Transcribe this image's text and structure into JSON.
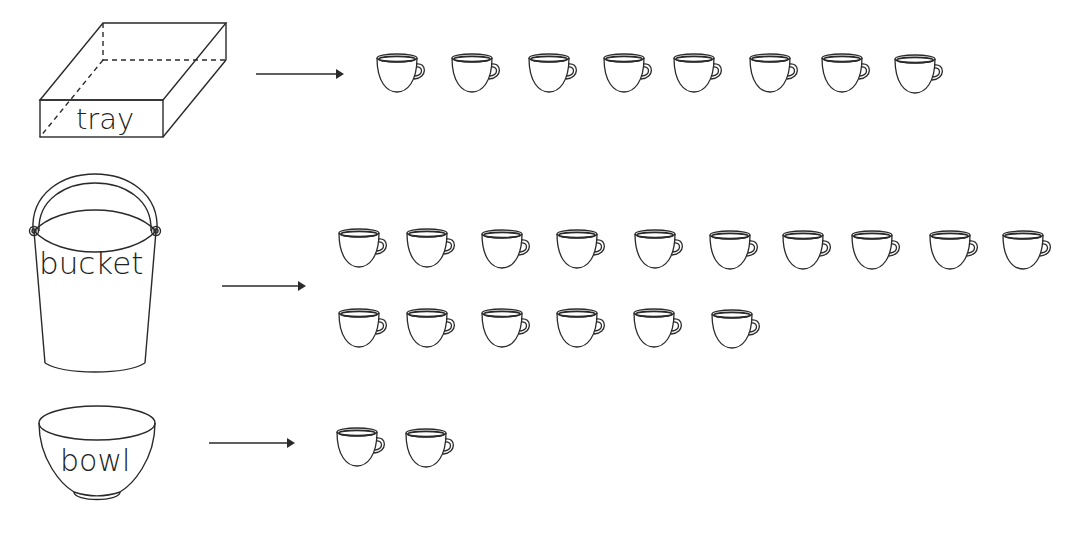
{
  "rows": [
    {
      "container": "tray",
      "label": "tray",
      "cups": 8,
      "cup_positions": [
        [
          375,
          52
        ],
        [
          450,
          52
        ],
        [
          527,
          52
        ],
        [
          602,
          52
        ],
        [
          672,
          52
        ],
        [
          748,
          52
        ],
        [
          820,
          52
        ],
        [
          893,
          53
        ]
      ]
    },
    {
      "container": "bucket",
      "label": "bucket",
      "cups": 16,
      "cup_positions": [
        [
          337,
          227
        ],
        [
          405,
          227
        ],
        [
          480,
          228
        ],
        [
          555,
          228
        ],
        [
          633,
          228
        ],
        [
          708,
          229
        ],
        [
          781,
          229
        ],
        [
          850,
          229
        ],
        [
          928,
          229
        ],
        [
          1001,
          229
        ],
        [
          337,
          307
        ],
        [
          405,
          307
        ],
        [
          480,
          307
        ],
        [
          555,
          307
        ],
        [
          632,
          307
        ],
        [
          710,
          308
        ]
      ]
    },
    {
      "container": "bowl",
      "label": "bowl",
      "cups": 2,
      "cup_positions": [
        [
          335,
          426
        ],
        [
          404,
          427
        ]
      ]
    }
  ],
  "colors": {
    "line": "#2a2a2a",
    "background": "#ffffff"
  }
}
